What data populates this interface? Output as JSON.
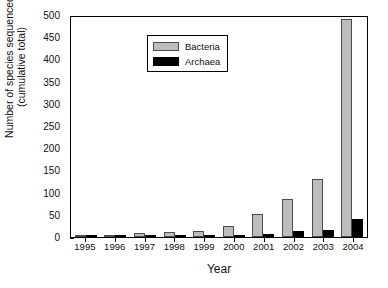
{
  "chart_data": {
    "type": "bar",
    "title": "",
    "xlabel": "Year",
    "ylabel_line1": "Number of species sequenced",
    "ylabel_line2": "(cumulative total)",
    "categories": [
      "1995",
      "1996",
      "1997",
      "1998",
      "1999",
      "2000",
      "2001",
      "2002",
      "2003",
      "2004"
    ],
    "series": [
      {
        "name": "Bacteria",
        "color": "#bdbdbd",
        "values": [
          1,
          4,
          8,
          12,
          14,
          25,
          52,
          85,
          130,
          490
        ]
      },
      {
        "name": "Archaea",
        "color": "#000000",
        "values": [
          0,
          1,
          1,
          2,
          3,
          5,
          7,
          13,
          15,
          40
        ]
      }
    ],
    "ylim": [
      0,
      500
    ],
    "yticks": [
      500,
      450,
      400,
      350,
      300,
      250,
      200,
      150,
      100,
      50,
      0
    ],
    "ytick_labels": [
      "500",
      "450",
      "400",
      "350",
      "300",
      "250",
      "200",
      "150",
      "100",
      "50",
      "0"
    ],
    "grid": false,
    "legend_position": "top-left",
    "legend": [
      "Bacteria",
      "Archaea"
    ]
  }
}
